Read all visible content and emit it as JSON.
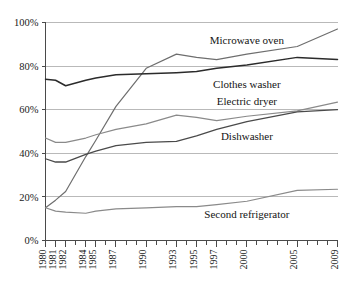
{
  "chart_data": {
    "type": "line",
    "title": "",
    "subtitle": "",
    "xlabel": "",
    "ylabel": "",
    "xlim": [
      1980,
      2009
    ],
    "ylim": [
      0,
      100
    ],
    "grid": true,
    "legend_position": "inline-labels",
    "y_ticks": [
      "0%",
      "20%",
      "40%",
      "60%",
      "80%",
      "100%"
    ],
    "y_tick_values": [
      0,
      20,
      40,
      60,
      80,
      100
    ],
    "x_tick_labels": [
      "1980",
      "1981",
      "1982",
      "1984",
      "1985",
      "1987",
      "1990",
      "1993",
      "1995",
      "1997",
      "2000",
      "2005",
      "2009"
    ],
    "x_tick_values": [
      1980,
      1981,
      1982,
      1984,
      1985,
      1987,
      1990,
      1993,
      1995,
      1997,
      2000,
      2005,
      2009
    ],
    "x_all_ticks": [
      1980,
      1981,
      1982,
      1983,
      1984,
      1985,
      1986,
      1987,
      1988,
      1989,
      1990,
      1991,
      1992,
      1993,
      1994,
      1995,
      1996,
      1997,
      1998,
      1999,
      2000,
      2001,
      2002,
      2003,
      2004,
      2005,
      2006,
      2007,
      2008,
      2009
    ],
    "x": [
      1980,
      1981,
      1982,
      1984,
      1985,
      1987,
      1990,
      1993,
      1995,
      1997,
      2000,
      2005,
      2009
    ],
    "series": [
      {
        "name": "Microwave oven",
        "color": "#6e6e6e",
        "width": 1.2,
        "values": [
          15,
          18.5,
          22.5,
          38.5,
          46,
          61.5,
          79,
          85.5,
          84,
          83,
          85.5,
          89,
          97
        ],
        "label_x": 2000,
        "label_y": 92
      },
      {
        "name": "Clothes washer",
        "color": "#2b2b2b",
        "width": 1.5,
        "values": [
          74,
          73.5,
          71,
          73.5,
          74.5,
          76,
          76.5,
          77,
          77.5,
          79,
          80.5,
          84,
          83
        ],
        "label_x": 2000,
        "label_y": 72
      },
      {
        "name": "Electric dryer",
        "color": "#8a8a8a",
        "width": 1.2,
        "values": [
          47,
          45,
          45,
          47,
          48.5,
          51,
          53.5,
          57.5,
          56.5,
          55,
          57,
          59.5,
          63.5
        ],
        "label_x": 2000,
        "label_y": 64
      },
      {
        "name": "Dishwasher",
        "color": "#4a4a4a",
        "width": 1.3,
        "values": [
          37.5,
          36,
          36,
          39.5,
          41,
          43.5,
          45,
          45.5,
          48,
          51,
          54.5,
          59,
          60
        ],
        "label_x": 2000,
        "label_y": 48
      },
      {
        "name": "Second refrigerator",
        "color": "#8a8a8a",
        "width": 1.2,
        "values": [
          15,
          13.5,
          13,
          12.5,
          13.5,
          14.5,
          15,
          15.5,
          15.5,
          16.5,
          18,
          23,
          23.5
        ],
        "label_x": 2000,
        "label_y": 12
      }
    ]
  }
}
